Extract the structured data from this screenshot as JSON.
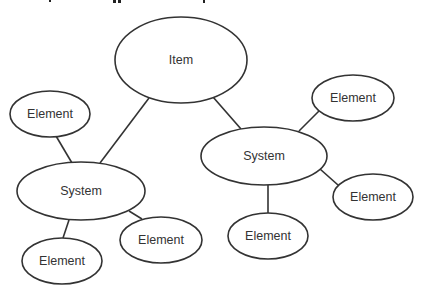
{
  "diagram": {
    "type": "hierarchy",
    "nodes": [
      {
        "id": "item",
        "label": "Item",
        "cx": 181,
        "cy": 60,
        "rx": 66,
        "ry": 43
      },
      {
        "id": "system-left",
        "label": "System",
        "cx": 81,
        "cy": 191,
        "rx": 64,
        "ry": 29
      },
      {
        "id": "system-right",
        "label": "System",
        "cx": 264,
        "cy": 156,
        "rx": 63,
        "ry": 29
      },
      {
        "id": "element-left-top",
        "label": "Element",
        "cx": 50,
        "cy": 114,
        "rx": 40,
        "ry": 23
      },
      {
        "id": "element-left-bottom",
        "label": "Element",
        "cx": 62,
        "cy": 261,
        "rx": 40,
        "ry": 23
      },
      {
        "id": "element-left-right",
        "label": "Element",
        "cx": 161,
        "cy": 240,
        "rx": 41,
        "ry": 23
      },
      {
        "id": "element-right-top",
        "label": "Element",
        "cx": 353,
        "cy": 98,
        "rx": 41,
        "ry": 23
      },
      {
        "id": "element-right-right",
        "label": "Element",
        "cx": 373,
        "cy": 197,
        "rx": 40,
        "ry": 23
      },
      {
        "id": "element-right-bottom",
        "label": "Element",
        "cx": 268,
        "cy": 236,
        "rx": 40,
        "ry": 23
      }
    ],
    "edges": [
      {
        "from": "item",
        "to": "system-left",
        "x1": 149,
        "y1": 98,
        "x2": 100,
        "y2": 163
      },
      {
        "from": "item",
        "to": "system-right",
        "x1": 213,
        "y1": 97,
        "x2": 241,
        "y2": 129
      },
      {
        "from": "system-left",
        "to": "element-left-top",
        "x1": 72,
        "y1": 163,
        "x2": 56,
        "y2": 136
      },
      {
        "from": "system-left",
        "to": "element-left-bottom",
        "x1": 69,
        "y1": 220,
        "x2": 63,
        "y2": 238
      },
      {
        "from": "system-left",
        "to": "element-left-right",
        "x1": 129,
        "y1": 211,
        "x2": 142,
        "y2": 219
      },
      {
        "from": "system-right",
        "to": "element-right-top",
        "x1": 299,
        "y1": 131,
        "x2": 319,
        "y2": 111
      },
      {
        "from": "system-right",
        "to": "element-right-right",
        "x1": 320,
        "y1": 169,
        "x2": 338,
        "y2": 185
      },
      {
        "from": "system-right",
        "to": "element-right-bottom",
        "x1": 268,
        "y1": 185,
        "x2": 268,
        "y2": 213
      }
    ]
  },
  "labels": {
    "item": "Item",
    "system": "System",
    "element": "Element"
  }
}
